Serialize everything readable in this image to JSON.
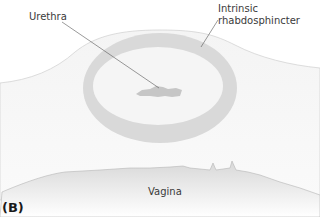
{
  "figure": {
    "panel_label": "(B)",
    "labels": {
      "urethra": "Urethra",
      "sphincter_line1": "Intrinsic",
      "sphincter_line2": "rhabdosphincter",
      "vagina": "Vagina"
    }
  }
}
